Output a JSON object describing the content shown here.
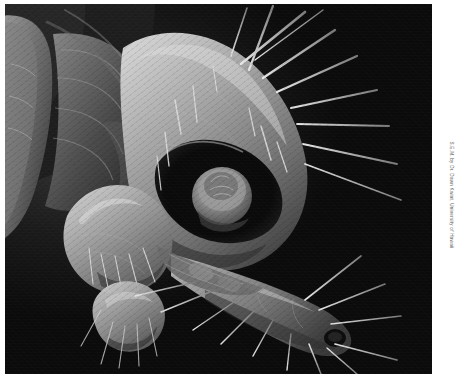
{
  "image": {
    "type": "scanning-electron-micrograph",
    "subject": "insect head (mosquito-like) in lateral view",
    "rendering": "grayscale, black background",
    "border": {
      "style": "white mount frame",
      "top_px": 4,
      "left_px": 5,
      "bottom_px": 15,
      "right_px": 38
    },
    "credit": "S.E.M. by Dr. Dawn Kwiat, University of Hawaii",
    "anatomy": [
      {
        "name": "compound-eye-socket",
        "note": "dark oval cavity with circular cylindrical element"
      },
      {
        "name": "head-capsule",
        "note": "large smooth dome, upper centre"
      },
      {
        "name": "maxillary-palp",
        "note": "rounded lobe at left with short bristles"
      },
      {
        "name": "proboscis",
        "note": "elongated tapering tube extending lower right"
      },
      {
        "name": "proboscis-tip",
        "note": "terminal opening with fine setae"
      },
      {
        "name": "antenna-base",
        "note": "segmented structure upper left"
      },
      {
        "name": "setae",
        "note": "long tapering sensory bristles radiating outward"
      }
    ],
    "palette": {
      "background": "#0a0a0a",
      "tissue_mid": "#8a8a8a",
      "tissue_light": "#c9c9c9",
      "tissue_dark": "#2b2b2b",
      "seta": "#d8d8d8",
      "frame": "#ffffff",
      "credit_text": "#5a5a5a"
    }
  }
}
